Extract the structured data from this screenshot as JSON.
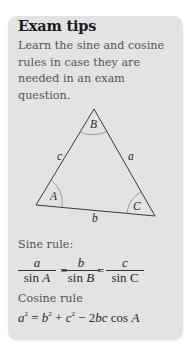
{
  "tip_box": {
    "title": "Exam tips",
    "body": "Learn the sine and cosine rules in case they are needed in an exam question.",
    "background": "#e3e3e3"
  },
  "triangle": {
    "vertices": {
      "A": "A",
      "B": "B",
      "C": "C"
    },
    "sides": {
      "a": "a",
      "b": "b",
      "c": "c"
    }
  },
  "sine_rule": {
    "label": "Sine rule:",
    "terms": [
      {
        "num": "a",
        "den_fn": "sin",
        "den_var": "A"
      },
      {
        "num": "b",
        "den_fn": "sin",
        "den_var": "B"
      },
      {
        "num": "c",
        "den_fn": "sin",
        "den_var": "C"
      }
    ],
    "equals": "="
  },
  "cosine_rule": {
    "label": "Cosine rule",
    "lhs": "a",
    "exp": "2",
    "eq": " = ",
    "t1": "b",
    "plus": " + ",
    "t2": "c",
    "minus": " − 2",
    "t3": "bc",
    "cos": " cos ",
    "ang": "A"
  }
}
